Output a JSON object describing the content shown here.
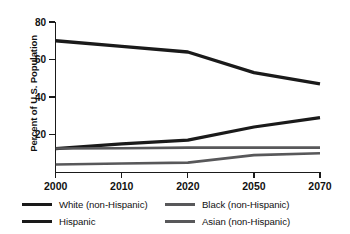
{
  "chart_data": {
    "type": "line",
    "title": "",
    "xlabel": "",
    "ylabel": "Percent of U.S. Population",
    "categories": [
      "2000",
      "2010",
      "2020",
      "2050",
      "2070"
    ],
    "xticks": [
      "2000",
      "2010",
      "2020",
      "2050",
      "2070"
    ],
    "yticks": [
      "20",
      "40",
      "60",
      "80"
    ],
    "ytick_values": [
      20,
      40,
      60,
      80
    ],
    "ylim": [
      0,
      80
    ],
    "grid": false,
    "legend_position": "below-plot",
    "series": [
      {
        "name": "White (non-Hispanic)",
        "color": "#1a1a1a",
        "values": [
          70,
          67,
          64,
          53,
          47
        ]
      },
      {
        "name": "Hispanic",
        "color": "#1a1a1a",
        "values": [
          12.5,
          15,
          17,
          24,
          29
        ]
      },
      {
        "name": "Black (non-Hispanic)",
        "color": "#58585a",
        "values": [
          12.5,
          12.7,
          13,
          13,
          13
        ]
      },
      {
        "name": "Asian (non-Hispanic)",
        "color": "#58585a",
        "values": [
          4,
          4.5,
          5,
          9,
          10
        ]
      }
    ]
  },
  "axis": {
    "y_title": "Percent of U.S. Population"
  },
  "legend": {
    "items": [
      {
        "label": "White (non-Hispanic)",
        "color": "#1a1a1a",
        "thickness": 3.6
      },
      {
        "label": "Black (non-Hispanic)",
        "color": "#58585a",
        "thickness": 3.0
      },
      {
        "label": "Hispanic",
        "color": "#1a1a1a",
        "thickness": 3.6
      },
      {
        "label": "Asian (non-Hispanic)",
        "color": "#58585a",
        "thickness": 3.0
      }
    ]
  }
}
